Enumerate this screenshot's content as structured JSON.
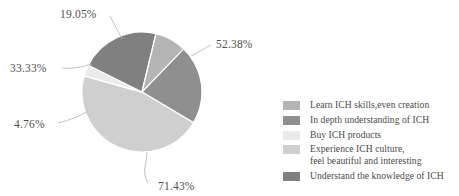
{
  "chart_data": {
    "type": "pie",
    "title": "",
    "subtitle": "",
    "xlabel": "",
    "ylabel": "",
    "grid": false,
    "legend_position": "right",
    "value_suffix": "%",
    "note": "Multiple-choice survey item: percentages sum to more than 100%; wedge angles are proportional to response counts.",
    "categories": [
      "Learn ICH skills,even creation",
      "In depth understanding of ICH",
      "Buy ICH products",
      "Experience ICH culture,\nfeel beautiful and interesting",
      "Understand the knowledge of ICH"
    ],
    "values": [
      19.05,
      52.38,
      4.76,
      71.43,
      33.33
    ],
    "labels": [
      "19.05%",
      "52.38%",
      "4.76%",
      "71.43%",
      "33.33%"
    ],
    "colors": [
      "#b4b4b4",
      "#8f8f8f",
      "#eaeaea",
      "#cfcfcf",
      "#808080"
    ],
    "slices": [
      {
        "label": "52.38%",
        "value": 52.38,
        "category": "In depth understanding of ICH",
        "color": "#8f8f8f",
        "start_angle": 0,
        "end_angle": 120.8,
        "label_x": 216,
        "label_y": 48,
        "leader": "M 191 56 C 199 52 205 48 211 45"
      },
      {
        "label": "71.43%",
        "value": 71.43,
        "category": "Experience ICH culture, feel beautiful and interesting",
        "color": "#cfcfcf",
        "start_angle": 120.8,
        "end_angle": 285.5,
        "label_x": 158,
        "label_y": 190,
        "leader": "M 147 152 C 147 166 141 170 148 183"
      },
      {
        "label": "4.76%",
        "value": 4.76,
        "category": "Buy ICH products",
        "color": "#eaeaea",
        "start_angle": 285.5,
        "end_angle": 296.5,
        "label_x": 14,
        "label_y": 128,
        "leader": "M 88 111 C 80 116 70 120 58 123"
      },
      {
        "label": "33.33%",
        "value": 33.33,
        "category": "Understand the knowledge of ICH",
        "color": "#808080",
        "start_angle": 296.5,
        "end_angle": 373.5,
        "label_x": 10,
        "label_y": 72,
        "leader": "M 92 64 C 82 67 72 69 62 68"
      },
      {
        "label": "19.05%",
        "value": 19.05,
        "category": "Learn ICH skills,even creation",
        "color": "#b4b4b4",
        "start_angle": 373.5,
        "end_angle": 404,
        "label_x": 60,
        "label_y": 18,
        "leader": "M 122 39 C 118 31 114 24 110 16"
      }
    ],
    "geometry": {
      "cx": 142,
      "cy": 92,
      "r": 60
    }
  },
  "legend": {
    "items": [
      {
        "label": "Learn ICH skills,even creation",
        "color": "#b4b4b4"
      },
      {
        "label": "In depth understanding of ICH",
        "color": "#8f8f8f"
      },
      {
        "label": "Buy ICH products",
        "color": "#eaeaea"
      },
      {
        "label": "Experience ICH culture,\nfeel beautiful and interesting",
        "color": "#cfcfcf"
      },
      {
        "label": "Understand the knowledge of ICH",
        "color": "#808080"
      }
    ]
  }
}
